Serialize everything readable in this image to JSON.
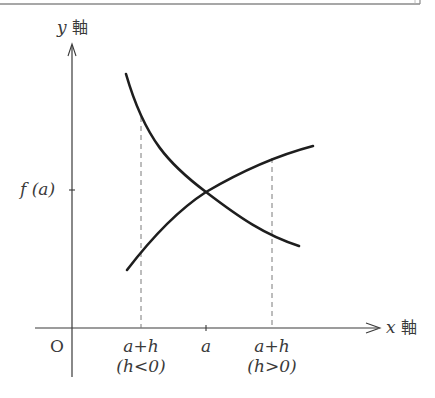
{
  "diagram": {
    "y_axis": {
      "var": "y",
      "word": "軸"
    },
    "x_axis": {
      "var": "x",
      "word": "軸"
    },
    "origin_label": "O",
    "y_tick_label": "f (a)",
    "x_ticks": [
      {
        "label": "a+h",
        "note": "(h<0)"
      },
      {
        "label": "a",
        "note": ""
      },
      {
        "label": "a+h",
        "note": "(h>0)"
      }
    ],
    "curves": [
      {
        "name": "decreasing-curve",
        "description": "decreasing curve passing through (a, f(a))"
      },
      {
        "name": "increasing-curve",
        "description": "increasing curve passing through (a, f(a))"
      }
    ],
    "colors": {
      "curve": "#1e1e1e",
      "axis": "#3a3a3a",
      "dashed": "#7a7a7a",
      "frame": "#8a8a8a"
    }
  }
}
